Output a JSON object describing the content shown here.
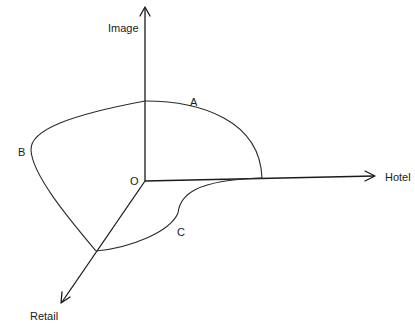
{
  "diagram": {
    "axes": {
      "vertical": "Image",
      "horizontal": "Hotel",
      "diagonal": "Retail"
    },
    "origin_label": "O",
    "curve_labels": {
      "a": "A",
      "b": "B",
      "c": "C"
    },
    "line_color": "#1a1a1a"
  }
}
